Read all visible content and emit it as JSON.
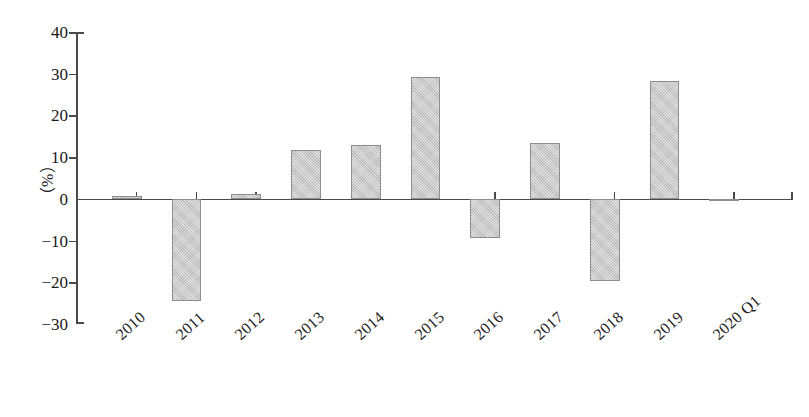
{
  "chart_data": {
    "type": "bar",
    "title": "",
    "xlabel": "",
    "ylabel": "（%）",
    "ylim": [
      -30,
      40
    ],
    "ytick_step": 10,
    "yticks": [
      40,
      30,
      20,
      10,
      0,
      -10,
      -20,
      -30
    ],
    "ytick_labels": [
      "40",
      "30",
      "20",
      "10",
      "0",
      "−10",
      "−20",
      "−30"
    ],
    "grid": false,
    "legend": null,
    "categories": [
      "2010",
      "2011",
      "2012",
      "2013",
      "2014",
      "2015",
      "2016",
      "2017",
      "2018",
      "2019",
      "2020 Q1"
    ],
    "values": [
      0.6,
      -24.5,
      1.1,
      11.6,
      12.9,
      29.2,
      -9.3,
      13.3,
      -19.8,
      28.2,
      -0.4
    ],
    "bar_fill_color": "#c9c9c9",
    "bar_border_color": "#8e8e8e",
    "axis_color": "#4a4a4a"
  }
}
